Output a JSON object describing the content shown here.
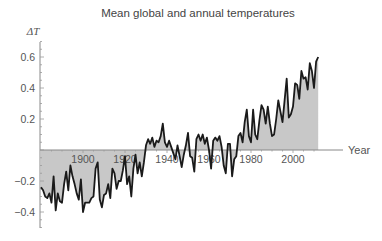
{
  "chart_data": {
    "type": "area",
    "title": "Mean global and annual temperatures",
    "xlabel": "Year",
    "ylabel": "ΔT",
    "xlim": [
      1880,
      2012
    ],
    "ylim": [
      -0.5,
      0.7
    ],
    "x_ticks": [
      1900,
      1920,
      1940,
      1960,
      1980,
      2000
    ],
    "y_ticks": [
      -0.4,
      -0.2,
      0.2,
      0.4,
      0.6
    ],
    "grid": false,
    "legend": null,
    "fill_color": "#c8c8c8",
    "line_color": "#1a1a1a",
    "x": [
      1880,
      1881,
      1882,
      1883,
      1884,
      1885,
      1886,
      1887,
      1888,
      1889,
      1890,
      1891,
      1892,
      1893,
      1894,
      1895,
      1896,
      1897,
      1898,
      1899,
      1900,
      1901,
      1902,
      1903,
      1904,
      1905,
      1906,
      1907,
      1908,
      1909,
      1910,
      1911,
      1912,
      1913,
      1914,
      1915,
      1916,
      1917,
      1918,
      1919,
      1920,
      1921,
      1922,
      1923,
      1924,
      1925,
      1926,
      1927,
      1928,
      1929,
      1930,
      1931,
      1932,
      1933,
      1934,
      1935,
      1936,
      1937,
      1938,
      1939,
      1940,
      1941,
      1942,
      1943,
      1944,
      1945,
      1946,
      1947,
      1948,
      1949,
      1950,
      1951,
      1952,
      1953,
      1954,
      1955,
      1956,
      1957,
      1958,
      1959,
      1960,
      1961,
      1962,
      1963,
      1964,
      1965,
      1966,
      1967,
      1968,
      1969,
      1970,
      1971,
      1972,
      1973,
      1974,
      1975,
      1976,
      1977,
      1978,
      1979,
      1980,
      1981,
      1982,
      1983,
      1984,
      1985,
      1986,
      1987,
      1988,
      1989,
      1990,
      1991,
      1992,
      1993,
      1994,
      1995,
      1996,
      1997,
      1998,
      1999,
      2000,
      2001,
      2002,
      2003,
      2004,
      2005,
      2006,
      2007,
      2008,
      2009,
      2010,
      2011,
      2012
    ],
    "values": [
      -0.24,
      -0.26,
      -0.3,
      -0.31,
      -0.28,
      -0.34,
      -0.17,
      -0.39,
      -0.28,
      -0.33,
      -0.34,
      -0.22,
      -0.14,
      -0.26,
      -0.1,
      -0.17,
      -0.22,
      -0.28,
      -0.32,
      -0.19,
      -0.4,
      -0.34,
      -0.34,
      -0.34,
      -0.31,
      -0.3,
      -0.12,
      -0.08,
      -0.32,
      -0.37,
      -0.29,
      -0.28,
      -0.22,
      -0.31,
      -0.12,
      -0.15,
      -0.25,
      -0.2,
      -0.2,
      -0.13,
      -0.04,
      -0.22,
      -0.17,
      -0.3,
      -0.12,
      -0.03,
      -0.15,
      -0.08,
      -0.17,
      -0.08,
      0.03,
      0.07,
      0.04,
      0.08,
      0.02,
      0.06,
      0.05,
      0.09,
      0.17,
      0.05,
      0.02,
      0.06,
      0.02,
      -0.02,
      -0.06,
      0.03,
      -0.04,
      -0.11,
      -0.03,
      0.03,
      0.11,
      -0.04,
      -0.05,
      -0.14,
      0.07,
      0.1,
      0.06,
      0.1,
      0.04,
      0.08,
      0.0,
      -0.12,
      0.06,
      0.08,
      0.06,
      0.09,
      0.02,
      -0.1,
      -0.15,
      0.04,
      0.04,
      -0.17,
      -0.06,
      -0.04,
      0.09,
      0.11,
      0.05,
      0.18,
      0.26,
      0.09,
      0.05,
      0.26,
      0.1,
      0.07,
      0.19,
      0.29,
      0.26,
      0.17,
      0.28,
      0.17,
      0.09,
      0.1,
      0.2,
      0.32,
      0.25,
      0.18,
      0.32,
      0.46,
      0.21,
      0.23,
      0.28,
      0.43,
      0.42,
      0.33,
      0.51,
      0.46,
      0.47,
      0.39,
      0.56,
      0.51,
      0.4,
      0.57,
      0.6
    ]
  }
}
